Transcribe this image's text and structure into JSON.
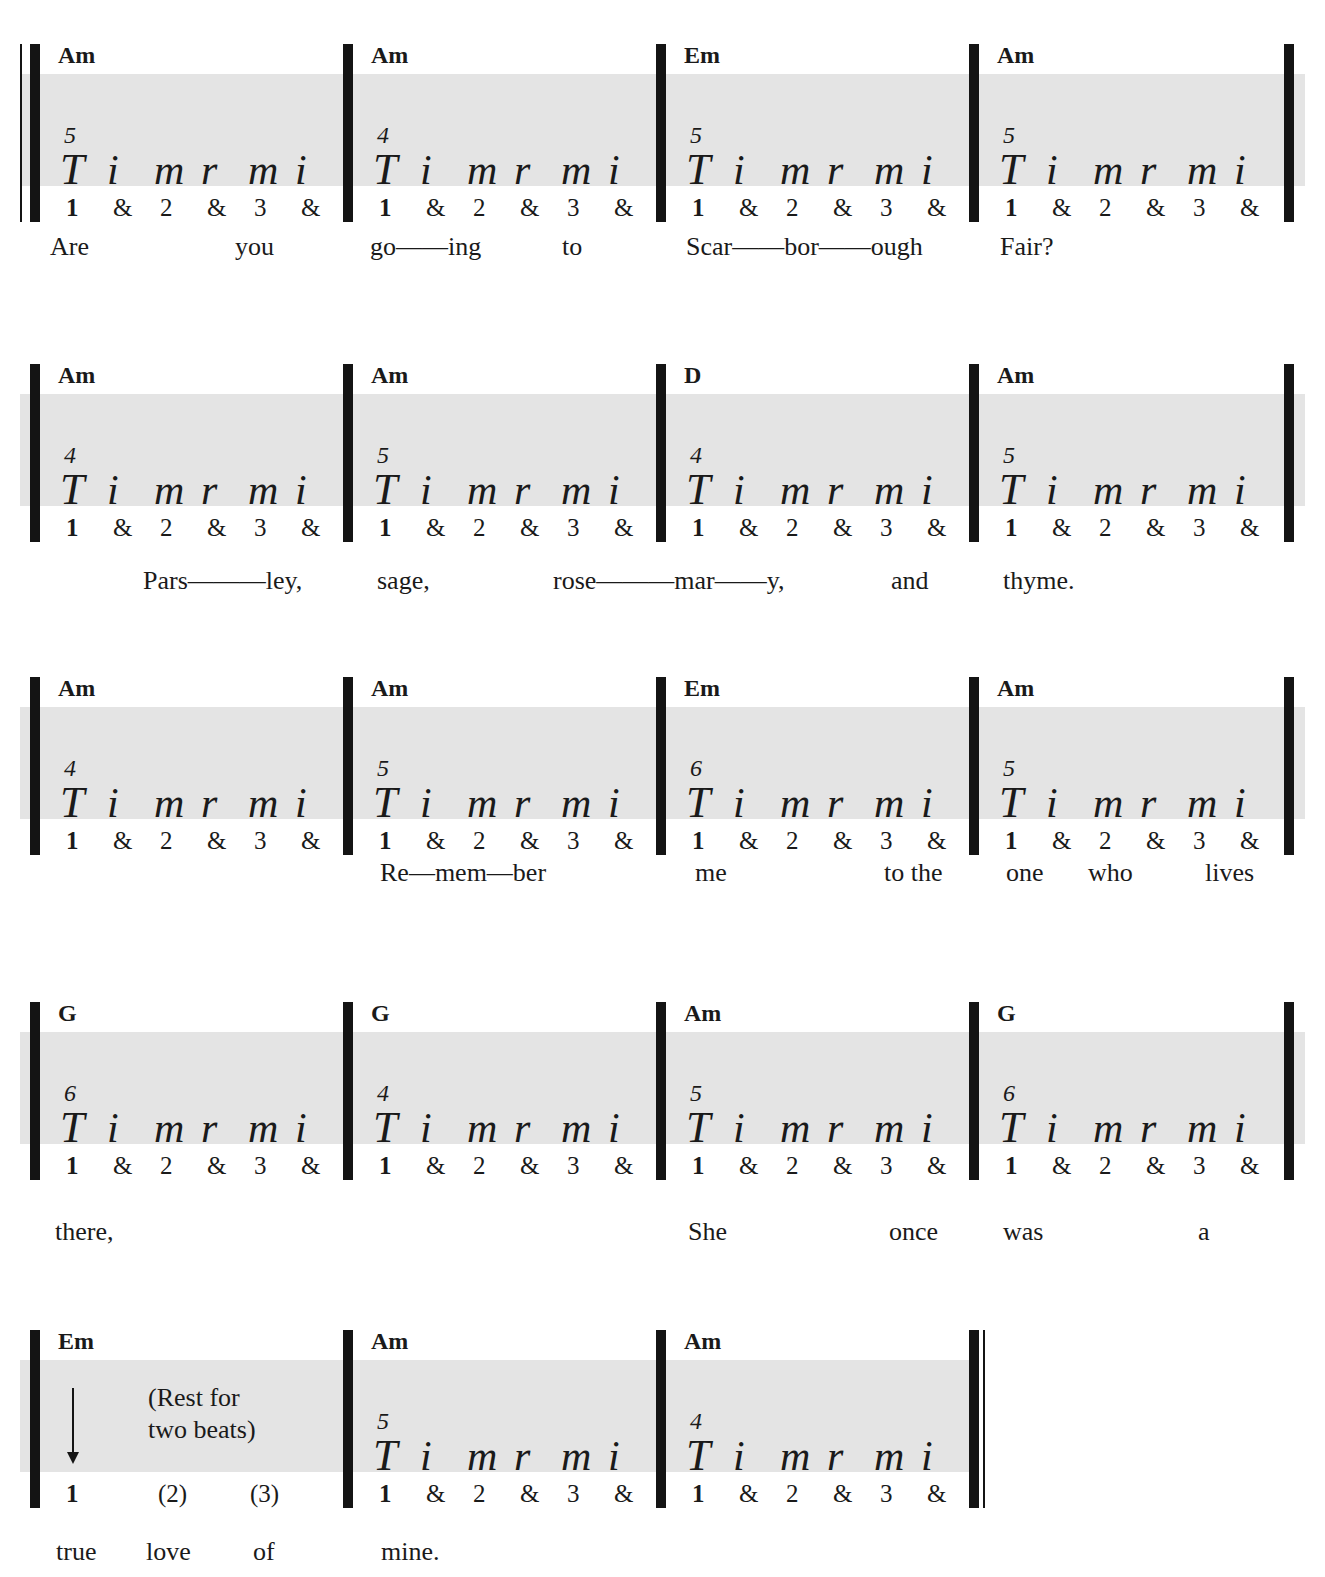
{
  "finger_pattern": [
    "T",
    "i",
    "m",
    "r",
    "m",
    "i"
  ],
  "count_pattern": [
    "1",
    "&",
    "2",
    "&",
    "3",
    "&"
  ],
  "systems": [
    {
      "measures": [
        {
          "chord": "Am",
          "fret": "5"
        },
        {
          "chord": "Am",
          "fret": "4"
        },
        {
          "chord": "Em",
          "fret": "5"
        },
        {
          "chord": "Am",
          "fret": "5"
        }
      ],
      "lyrics": [
        "Are",
        "you",
        "go——ing",
        "to",
        "Scar——bor——ough",
        "Fair?"
      ]
    },
    {
      "measures": [
        {
          "chord": "Am",
          "fret": "4"
        },
        {
          "chord": "Am",
          "fret": "5"
        },
        {
          "chord": "D",
          "fret": "4"
        },
        {
          "chord": "Am",
          "fret": "5"
        }
      ],
      "lyrics": [
        "Pars———ley,",
        "sage,",
        "rose———mar——y,",
        "and",
        "thyme."
      ]
    },
    {
      "measures": [
        {
          "chord": "Am",
          "fret": "4"
        },
        {
          "chord": "Am",
          "fret": "5"
        },
        {
          "chord": "Em",
          "fret": "6"
        },
        {
          "chord": "Am",
          "fret": "5"
        }
      ],
      "lyrics": [
        "Re—mem—ber",
        "me",
        "to the",
        "one",
        "who",
        "lives"
      ]
    },
    {
      "measures": [
        {
          "chord": "G",
          "fret": "6"
        },
        {
          "chord": "G",
          "fret": "4"
        },
        {
          "chord": "Am",
          "fret": "5"
        },
        {
          "chord": "G",
          "fret": "6"
        }
      ],
      "lyrics": [
        "there,",
        "She",
        "once",
        "was",
        "a"
      ]
    },
    {
      "measures": [
        {
          "chord": "Em",
          "rest_note": [
            "(Rest for",
            "two beats)"
          ],
          "counts": [
            "1",
            "(2)",
            "(3)"
          ]
        },
        {
          "chord": "Am",
          "fret": "5"
        },
        {
          "chord": "Am",
          "fret": "4"
        }
      ],
      "lyrics": [
        "true",
        "love",
        "of",
        "mine."
      ]
    }
  ]
}
